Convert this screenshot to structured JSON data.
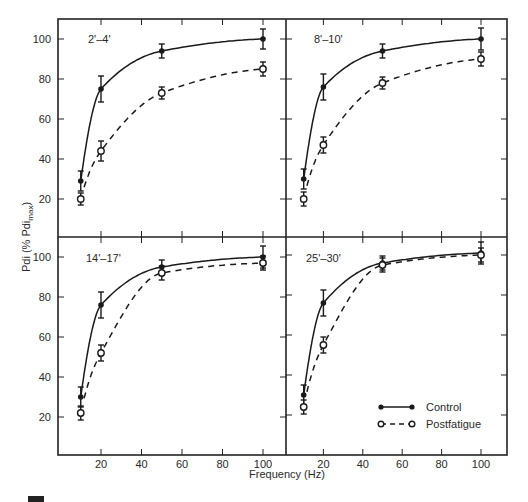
{
  "chart_data": {
    "type": "line",
    "layout": "2x2 panels, shared axes",
    "xlabel": "Frequency (Hz)",
    "ylabel": "Pdi (% Pdi_max)",
    "ylabel_main": "Pdi (% Pdi",
    "ylabel_sub": "max",
    "ylabel_close": ")",
    "x_ticks": [
      20,
      40,
      60,
      80,
      100
    ],
    "y_ticks": [
      20,
      40,
      60,
      80,
      100
    ],
    "xlim": [
      0,
      110
    ],
    "ylim": [
      0,
      110
    ],
    "grid": false,
    "legend": {
      "position": "lower right of bottom-right panel",
      "entries": [
        {
          "name": "Control",
          "style": "solid line, filled circle"
        },
        {
          "name": "Postfatigue",
          "style": "dashed line, open circle"
        }
      ]
    },
    "x": [
      10,
      20,
      50,
      100
    ],
    "panels": [
      {
        "label": "2'–4'",
        "series": [
          {
            "name": "Control",
            "values": [
              29,
              75,
              94,
              100
            ],
            "errors": [
              5,
              6.5,
              3.5,
              5
            ]
          },
          {
            "name": "Postfatigue",
            "values": [
              20,
              44,
              73,
              85
            ],
            "errors": [
              3,
              5,
              3,
              3.5
            ]
          }
        ]
      },
      {
        "label": "8'–10'",
        "series": [
          {
            "name": "Control",
            "values": [
              30,
              76,
              94,
              100
            ],
            "errors": [
              5,
              6.5,
              3.5,
              5.5
            ]
          },
          {
            "name": "Postfatigue",
            "values": [
              20,
              47,
              78,
              90
            ],
            "errors": [
              3.5,
              4,
              3,
              3.5
            ]
          }
        ]
      },
      {
        "label": "14'–17'",
        "series": [
          {
            "name": "Control",
            "values": [
              30,
              76,
              95,
              100
            ],
            "errors": [
              5,
              6.5,
              3.5,
              5.5
            ]
          },
          {
            "name": "Postfatigue",
            "values": [
              22,
              52,
              92,
              97
            ],
            "errors": [
              3.5,
              4,
              3.5,
              3.5
            ]
          }
        ]
      },
      {
        "label": "25'–30'",
        "series": [
          {
            "name": "Control",
            "values": [
              30,
              76,
              96,
              101
            ],
            "errors": [
              5,
              6.5,
              3.5,
              5.5
            ]
          },
          {
            "name": "Postfatigue",
            "values": [
              24,
              55,
              95,
              100
            ],
            "errors": [
              3.5,
              4,
              3.5,
              3.5
            ]
          }
        ]
      }
    ]
  },
  "axis": {
    "x_title": "Frequency (Hz)",
    "y_title_main": "Pdi (% Pdi",
    "y_title_sub": "max",
    "y_title_close": ")",
    "x_tick_labels": [
      "20",
      "40",
      "60",
      "80",
      "100"
    ],
    "y_tick_labels": [
      "20",
      "40",
      "60",
      "80",
      "100"
    ]
  },
  "legend": {
    "control_label": "Control",
    "post_label": "Postfatigue"
  },
  "panels": {
    "p0": {
      "label": "2'–4'"
    },
    "p1": {
      "label": "8'–10'"
    },
    "p2": {
      "label": "14'–17'"
    },
    "p3": {
      "label": "25'–30'"
    }
  }
}
